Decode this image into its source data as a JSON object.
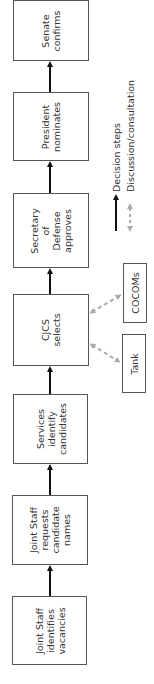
{
  "diagram": {
    "orientation": "rotated-90-ccw",
    "steps": [
      {
        "id": "senate",
        "label": "Senate\nconfirms"
      },
      {
        "id": "president",
        "label": "President\nnominates"
      },
      {
        "id": "secdef",
        "label": "Secretary\nof\nDefense\napproves"
      },
      {
        "id": "cjcs",
        "label": "CJCS\nselects"
      },
      {
        "id": "services",
        "label": "Services\nidentify\ncandidates"
      },
      {
        "id": "js-requests",
        "label": "Joint Staff\nrequests\ncandidate\nnames"
      },
      {
        "id": "js-identifies",
        "label": "Joint Staff\nidentifies\nvacancies"
      }
    ],
    "consultations": [
      {
        "id": "cocoms",
        "label": "COCOMs"
      },
      {
        "id": "tank",
        "label": "Tank"
      }
    ],
    "legend": {
      "decision_label": "Decision steps",
      "discussion_label": "Discussion/consultation"
    },
    "colors": {
      "decision_arrow": "#111111",
      "discussion_arrow": "#aaaaaa",
      "box_border": "#555555",
      "text": "#333333"
    }
  }
}
